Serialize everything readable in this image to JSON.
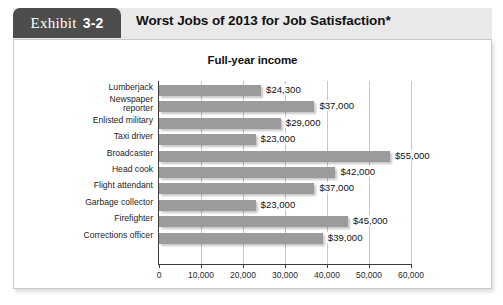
{
  "exhibit": {
    "label_word": "Exhibit",
    "label_number": "3-2"
  },
  "header": {
    "title": "Worst Jobs of 2013 for Job Satisfaction*"
  },
  "chart_data": {
    "type": "bar",
    "orientation": "horizontal",
    "title": "Full-year income",
    "xlabel": "",
    "ylabel": "",
    "xlim": [
      0,
      60000
    ],
    "xticks": [
      0,
      10000,
      20000,
      30000,
      40000,
      50000,
      60000
    ],
    "xtick_labels": [
      "0",
      "10,000",
      "20,000",
      "30,000",
      "40,000",
      "50,000",
      "60,000"
    ],
    "grid": true,
    "legend": false,
    "bar_color": "#9b9b9b",
    "categories": [
      "Lumberjack",
      "Newspaper\nreporter",
      "Enlisted military",
      "Taxi driver",
      "Broadcaster",
      "Head cook",
      "Flight attendant",
      "Garbage collector",
      "Firefighter",
      "Corrections officer"
    ],
    "values": [
      24300,
      37000,
      29000,
      23000,
      55000,
      42000,
      37000,
      23000,
      45000,
      39000
    ],
    "value_labels": [
      "$24,300",
      "$37,000",
      "$29,000",
      "$23,000",
      "$55,000",
      "$42,000",
      "$37,000",
      "$23,000",
      "$45,000",
      "$39,000"
    ]
  }
}
